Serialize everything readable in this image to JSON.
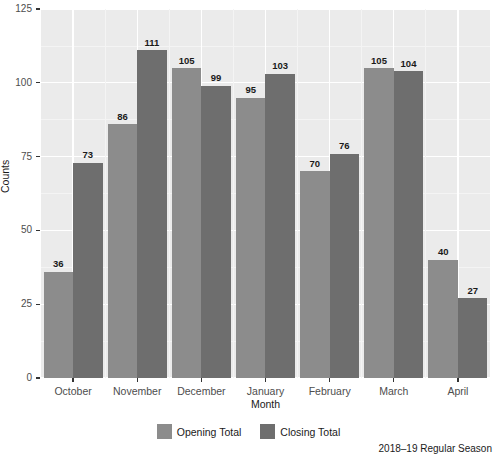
{
  "chart_data": {
    "type": "bar",
    "title": "",
    "subtitle": "",
    "caption": "2018–19 Regular Season",
    "xlabel": "Month",
    "ylabel": "Counts",
    "categories": [
      "October",
      "November",
      "December",
      "January",
      "February",
      "March",
      "April"
    ],
    "series": [
      {
        "name": "Opening Total",
        "color": "#8c8c8c",
        "values": [
          36,
          86,
          105,
          95,
          70,
          105,
          40
        ]
      },
      {
        "name": "Closing Total",
        "color": "#6e6e6e",
        "values": [
          73,
          111,
          99,
          103,
          76,
          104,
          27
        ]
      }
    ],
    "ylim": [
      0,
      125
    ],
    "y_ticks": [
      0,
      25,
      50,
      75,
      100,
      125
    ],
    "y_tick_labels": [
      "0",
      "25",
      "50",
      "75",
      "100",
      "125"
    ],
    "grid": true,
    "grid_color": "#ffffff",
    "panel_background": "#ebebeb",
    "legend_position": "bottom",
    "data_labels": true,
    "bar_position": "dodge"
  },
  "legend": {
    "items": [
      {
        "label": "Opening Total",
        "swatch_name": "legend-swatch-opening"
      },
      {
        "label": "Closing Total",
        "swatch_name": "legend-swatch-closing"
      }
    ]
  }
}
